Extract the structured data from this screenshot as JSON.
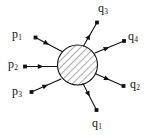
{
  "figure": {
    "type": "scattering-diagram",
    "background_color": "#ffffff",
    "line_color": "#111111",
    "blob": {
      "name": "interaction-blob",
      "shape": "circle",
      "center_x": 77.5,
      "center_y": 65,
      "radius": 20,
      "fill": "diagonal-hatch",
      "hatch_color": "#555555",
      "stroke_color": "#111111"
    },
    "incoming": [
      {
        "id": "p1",
        "label": "p",
        "subscript": "1",
        "label_x": 12,
        "label_y": 28,
        "start_x": 35.5,
        "start_y": 37.5,
        "end_x": 62.0,
        "end_y": 51.5,
        "arrow_t": 0.42,
        "dot_at": "start",
        "direction": "inward"
      },
      {
        "id": "p2",
        "label": "p",
        "subscript": "2",
        "label_x": 8,
        "label_y": 58,
        "start_x": 25.0,
        "start_y": 66.5,
        "end_x": 57.5,
        "end_y": 66.5,
        "arrow_t": 0.48,
        "dot_at": "start",
        "direction": "inward"
      },
      {
        "id": "p3",
        "label": "p",
        "subscript": "3",
        "label_x": 12,
        "label_y": 85,
        "start_x": 31.5,
        "start_y": 92.0,
        "end_x": 61.0,
        "end_y": 79.0,
        "arrow_t": 0.47,
        "dot_at": "start",
        "direction": "inward"
      }
    ],
    "outgoing": [
      {
        "id": "q3",
        "label": "q",
        "subscript": "3",
        "label_x": 98,
        "label_y": 2,
        "start_x": 83.5,
        "start_y": 46.0,
        "end_x": 97.0,
        "end_y": 22.5,
        "arrow_t": 0.4,
        "dot_at": "end",
        "direction": "outward"
      },
      {
        "id": "q4",
        "label": "q",
        "subscript": "4",
        "label_x": 128,
        "label_y": 30,
        "start_x": 95.0,
        "start_y": 53.0,
        "end_x": 124.0,
        "end_y": 41.0,
        "arrow_t": 0.4,
        "dot_at": "end",
        "direction": "outward"
      },
      {
        "id": "q2",
        "label": "q",
        "subscript": "2",
        "label_x": 130,
        "label_y": 78,
        "start_x": 96.0,
        "start_y": 74.0,
        "end_x": 123.5,
        "end_y": 86.0,
        "arrow_t": 0.4,
        "dot_at": "end",
        "direction": "outward"
      },
      {
        "id": "q1",
        "label": "q",
        "subscript": "1",
        "label_x": 92,
        "label_y": 117,
        "start_x": 83.0,
        "start_y": 83.5,
        "end_x": 96.5,
        "end_y": 110.0,
        "arrow_t": 0.4,
        "dot_at": "end",
        "direction": "outward"
      }
    ]
  }
}
